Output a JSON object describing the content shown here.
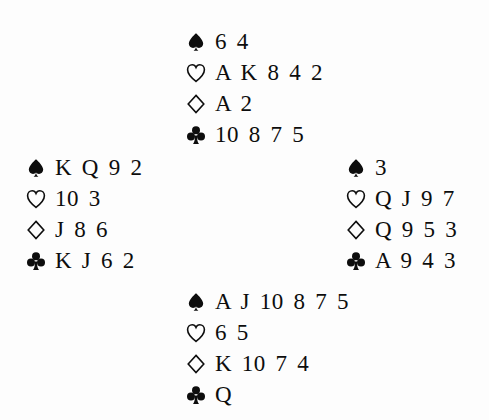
{
  "document": {
    "type": "bridge-deal-diagram",
    "background_color": "#fdfdfd",
    "ink_color": "#0d0d0d"
  },
  "suits": {
    "spade": {
      "name": "spade-icon",
      "glyph": "♠",
      "fill": "solid"
    },
    "heart": {
      "name": "heart-icon",
      "glyph": "♡",
      "fill": "outline"
    },
    "diamond": {
      "name": "diamond-icon",
      "glyph": "♢",
      "fill": "outline"
    },
    "club": {
      "name": "club-icon",
      "glyph": "♣",
      "fill": "solid"
    }
  },
  "hands": {
    "north": {
      "position": "North",
      "spades": "6 4",
      "hearts": "A K 8 4 2",
      "diamonds": "A 2",
      "clubs": "10 8 7 5"
    },
    "west": {
      "position": "West",
      "spades": "K Q 9 2",
      "hearts": "10 3",
      "diamonds": "J 8 6",
      "clubs": "K J 6 2"
    },
    "east": {
      "position": "East",
      "spades": "3",
      "hearts": "Q J 9 7",
      "diamonds": "Q 9 5 3",
      "clubs": "A 9 4 3"
    },
    "south": {
      "position": "South",
      "spades": "A J 10 8 7 5",
      "hearts": "6 5",
      "diamonds": "K 10 7 4",
      "clubs": "Q"
    }
  }
}
